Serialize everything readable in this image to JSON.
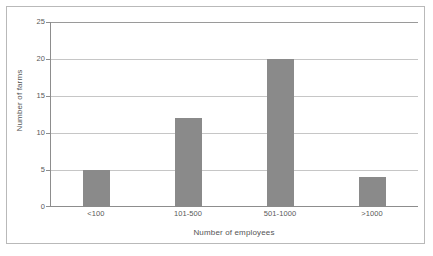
{
  "chart_data": {
    "type": "bar",
    "title": "",
    "subtitle": "",
    "categories": [
      "<100",
      "101-500",
      "501-1000",
      ">1000"
    ],
    "values": [
      5,
      12,
      20,
      4
    ],
    "series": [
      {
        "name": "Number of farms",
        "values": [
          5,
          12,
          20,
          4
        ]
      }
    ],
    "xlabel": "Number of employees",
    "ylabel": "Number of farms",
    "ylim": [
      0,
      25
    ],
    "yticks": [
      0,
      5,
      10,
      15,
      20,
      25
    ],
    "ytick_labels": [
      "0",
      "5",
      "10",
      "15",
      "20",
      "25"
    ],
    "grid": "horizontal",
    "legend": "none",
    "bar_color": "#8a8a8a",
    "gridline_color": "#c6c6c6",
    "axis_color": "#8d8d8d",
    "background_color": "#ffffff",
    "frame_color": "#b9b9b9",
    "annotations": []
  }
}
